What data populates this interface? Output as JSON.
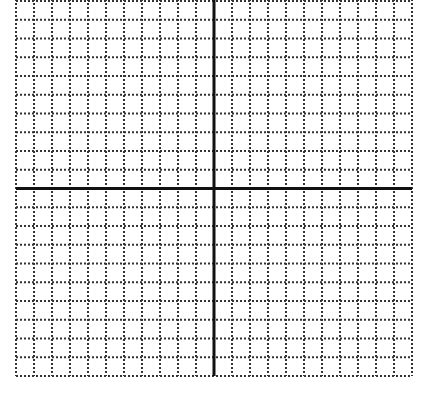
{
  "graph": {
    "title": "",
    "type": "coordinate-grid",
    "columns": 22,
    "rows": 20,
    "x_axis_row_from_top": 10,
    "y_axis_col_from_left": 11,
    "left": 16,
    "right": 412,
    "top": 1,
    "bottom": 376,
    "grid_color": "#333333",
    "axis_color": "#111111",
    "background": "#ffffff"
  }
}
